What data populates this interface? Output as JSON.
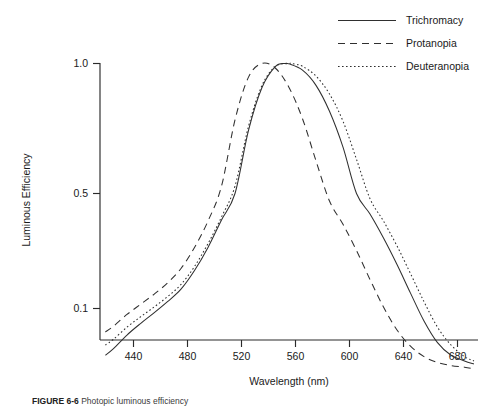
{
  "chart_data": {
    "type": "line",
    "title": "",
    "xlabel": "Wavelength (nm)",
    "ylabel": "Luminous Efficiency",
    "xlim": [
      420,
      700
    ],
    "ylim": [
      0.05,
      1.0
    ],
    "yscale": "log",
    "grid": false,
    "legend_position": "top-right",
    "xticks": [
      440,
      480,
      520,
      560,
      600,
      640,
      680
    ],
    "xtick_labels": [
      "440",
      "480",
      "520",
      "560",
      "600",
      "640",
      "680"
    ],
    "yticks": [
      1.0,
      0.5,
      0.1
    ],
    "ytick_labels": [
      "1.0",
      "0.5",
      "0.1"
    ],
    "series": [
      {
        "name": "Trichromacy",
        "style": "solid",
        "peak_nm": 557,
        "x": [
          424,
          430,
          440,
          450,
          460,
          470,
          480,
          490,
          500,
          510,
          520,
          530,
          540,
          550,
          557,
          560,
          570,
          580,
          590,
          600,
          610,
          620,
          630,
          640,
          650,
          660,
          670,
          680,
          690,
          697
        ],
        "y": [
          0.052,
          0.057,
          0.069,
          0.081,
          0.094,
          0.11,
          0.131,
          0.17,
          0.235,
          0.345,
          0.5,
          0.7,
          0.88,
          0.985,
          1.0,
          0.998,
          0.965,
          0.89,
          0.775,
          0.64,
          0.5,
          0.375,
          0.268,
          0.185,
          0.124,
          0.084,
          0.062,
          0.052,
          0.048,
          0.046
        ]
      },
      {
        "name": "Protanopia",
        "style": "dashed",
        "peak_nm": 540,
        "x": [
          424,
          430,
          440,
          450,
          460,
          470,
          480,
          490,
          500,
          510,
          520,
          530,
          540,
          550,
          560,
          570,
          580,
          590,
          600,
          610,
          620,
          630,
          640,
          650,
          660,
          670,
          680,
          690,
          697
        ],
        "y": [
          0.072,
          0.078,
          0.092,
          0.106,
          0.122,
          0.143,
          0.175,
          0.235,
          0.34,
          0.52,
          0.74,
          0.93,
          1.0,
          0.975,
          0.88,
          0.745,
          0.595,
          0.45,
          0.325,
          0.225,
          0.15,
          0.102,
          0.074,
          0.059,
          0.051,
          0.047,
          0.045,
          0.044,
          0.043
        ]
      },
      {
        "name": "Deuteranopia",
        "style": "dotted",
        "peak_nm": 562,
        "x": [
          424,
          430,
          440,
          450,
          460,
          470,
          480,
          490,
          500,
          510,
          520,
          530,
          540,
          550,
          560,
          562,
          570,
          580,
          590,
          600,
          610,
          620,
          630,
          640,
          650,
          660,
          670,
          680,
          690,
          697
        ],
        "y": [
          0.06,
          0.065,
          0.077,
          0.089,
          0.102,
          0.118,
          0.14,
          0.18,
          0.248,
          0.36,
          0.52,
          0.715,
          0.89,
          0.985,
          1.0,
          1.0,
          0.985,
          0.935,
          0.85,
          0.735,
          0.6,
          0.465,
          0.34,
          0.24,
          0.163,
          0.11,
          0.077,
          0.06,
          0.051,
          0.048
        ]
      }
    ]
  },
  "legend": {
    "items": [
      {
        "label": "Trichromacy",
        "style": "solid"
      },
      {
        "label": "Protanopia",
        "style": "dashed"
      },
      {
        "label": "Deuteranopia",
        "style": "dotted"
      }
    ]
  },
  "axes": {
    "x_title": "Wavelength (nm)",
    "y_title": "Luminous Efficiency"
  },
  "caption": {
    "figure_number": "FIGURE 6-6",
    "text": "Photopic luminous efficiency"
  }
}
